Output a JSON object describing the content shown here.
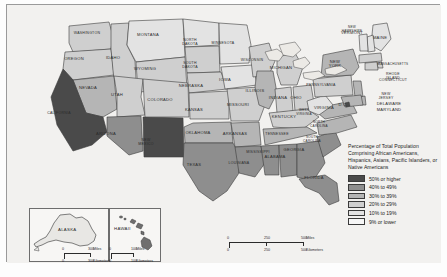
{
  "map": {
    "title_hidden": "",
    "legend": {
      "title": "Percentage of Total Population Comprising African Americans, Hispanics, Asians, Pacific Islanders, or Native Americans",
      "items": [
        {
          "label": "50% or higher",
          "color": "#4a4a4a"
        },
        {
          "label": "40% to 49%",
          "color": "#8e8e8e"
        },
        {
          "label": "30% to 39%",
          "color": "#b5b5b5"
        },
        {
          "label": "20% to 29%",
          "color": "#cfcfcf"
        },
        {
          "label": "10% to 19%",
          "color": "#e3e3e3"
        },
        {
          "label": "9% or lower",
          "color": "#f6f6f6"
        }
      ]
    },
    "scales": {
      "main": {
        "miles_label": "Miles",
        "km_label": "Kilometers",
        "miles_ticks": [
          "0",
          "250",
          "500"
        ],
        "km_ticks": [
          "0",
          "250",
          "500"
        ]
      },
      "alaska": {
        "miles_label": "Miles",
        "km_label": "Kilometers",
        "miles_ticks": [
          "0",
          "300"
        ],
        "km_ticks": [
          "0",
          "300"
        ]
      },
      "hawaii": {
        "miles_label": "Miles",
        "km_label": "Kilometers",
        "miles_ticks": [
          "0",
          "100"
        ],
        "km_ticks": [
          "0",
          "100"
        ]
      }
    },
    "insets": [
      {
        "name": "ALASKA"
      },
      {
        "name": "HAWAII"
      }
    ],
    "states": [
      {
        "name": "WASHINGTON",
        "tier": 3,
        "lx": 86,
        "ly": 33
      },
      {
        "name": "OREGON",
        "tier": 3,
        "lx": 73,
        "ly": 59
      },
      {
        "name": "IDAHO",
        "tier": 3,
        "lx": 112,
        "ly": 58
      },
      {
        "name": "MONTANA",
        "tier": 4,
        "lx": 147,
        "ly": 35
      },
      {
        "name": "WYOMING",
        "tier": 3,
        "lx": 144,
        "ly": 69
      },
      {
        "name": "NEVADA",
        "tier": 2,
        "lx": 87,
        "ly": 88
      },
      {
        "name": "UTAH",
        "tier": 3,
        "lx": 116,
        "ly": 95
      },
      {
        "name": "CALIFORNIA",
        "tier": 0,
        "lx": 58,
        "ly": 113
      },
      {
        "name": "ARIZONA",
        "tier": 1,
        "lx": 105,
        "ly": 134
      },
      {
        "name": "NEW MEXICO",
        "tier": 0,
        "lx": 145,
        "ly": 140
      },
      {
        "name": "COLORADO",
        "tier": 3,
        "lx": 159,
        "ly": 100
      },
      {
        "name": "NORTH DAKOTA",
        "tier": 4,
        "lx": 189,
        "ly": 40
      },
      {
        "name": "SOUTH DAKOTA",
        "tier": 3,
        "lx": 189,
        "ly": 63
      },
      {
        "name": "NEBRASKA",
        "tier": 3,
        "lx": 190,
        "ly": 86
      },
      {
        "name": "KANSAS",
        "tier": 3,
        "lx": 193,
        "ly": 110
      },
      {
        "name": "OKLAHOMA",
        "tier": 2,
        "lx": 197,
        "ly": 133
      },
      {
        "name": "TEXAS",
        "tier": 1,
        "lx": 193,
        "ly": 165
      },
      {
        "name": "MINNESOTA",
        "tier": 4,
        "lx": 222,
        "ly": 43
      },
      {
        "name": "IOWA",
        "tier": 4,
        "lx": 224,
        "ly": 80
      },
      {
        "name": "MISSOURI",
        "tier": 3,
        "lx": 237,
        "ly": 105
      },
      {
        "name": "ARKANSAS",
        "tier": 2,
        "lx": 234,
        "ly": 134
      },
      {
        "name": "LOUISIANA",
        "tier": 1,
        "lx": 238,
        "ly": 163
      },
      {
        "name": "WISCONSIN",
        "tier": 3,
        "lx": 251,
        "ly": 60
      },
      {
        "name": "ILLINOIS",
        "tier": 2,
        "lx": 254,
        "ly": 91
      },
      {
        "name": "MICHIGAN",
        "tier": 3,
        "lx": 280,
        "ly": 68
      },
      {
        "name": "INDIANA",
        "tier": 3,
        "lx": 277,
        "ly": 98
      },
      {
        "name": "OHIO",
        "tier": 3,
        "lx": 295,
        "ly": 98
      },
      {
        "name": "KENTUCKY",
        "tier": 3,
        "lx": 283,
        "ly": 117
      },
      {
        "name": "TENNESSEE",
        "tier": 2,
        "lx": 276,
        "ly": 134
      },
      {
        "name": "MISSISSIPPI",
        "tier": 1,
        "lx": 257,
        "ly": 152
      },
      {
        "name": "ALABAMA",
        "tier": 1,
        "lx": 274,
        "ly": 157
      },
      {
        "name": "GEORGIA",
        "tier": 1,
        "lx": 293,
        "ly": 150
      },
      {
        "name": "FLORIDA",
        "tier": 1,
        "lx": 313,
        "ly": 178
      },
      {
        "name": "SOUTH CAROLINA",
        "tier": 1,
        "lx": 311,
        "ly": 137
      },
      {
        "name": "NORTH CAROLINA",
        "tier": 2,
        "lx": 318,
        "ly": 122
      },
      {
        "name": "VIRGINIA",
        "tier": 2,
        "lx": 323,
        "ly": 108
      },
      {
        "name": "WEST VIRGINIA",
        "tier": 4,
        "lx": 303,
        "ly": 110
      },
      {
        "name": "PENNSYLVANIA",
        "tier": 3,
        "lx": 320,
        "ly": 85
      },
      {
        "name": "NEW YORK",
        "tier": 2,
        "lx": 334,
        "ly": 62
      },
      {
        "name": "MAINE",
        "tier": 4,
        "lx": 379,
        "ly": 38
      },
      {
        "name": "NEW HAMPSHIRE",
        "tier": 4,
        "lx": 351,
        "ly": 27
      },
      {
        "name": "VERMONT",
        "tier": 4,
        "lx": 351,
        "ly": 33
      },
      {
        "name": "MASSACHUSETTS",
        "tier": 3,
        "lx": 392,
        "ly": 64
      },
      {
        "name": "RHODE ISLAND",
        "tier": 3,
        "lx": 392,
        "ly": 74
      },
      {
        "name": "CONNECTICUT",
        "tier": 3,
        "lx": 392,
        "ly": 80
      },
      {
        "name": "NEW JERSEY",
        "tier": 2,
        "lx": 385,
        "ly": 94
      },
      {
        "name": "DELAWARE",
        "tier": 2,
        "lx": 388,
        "ly": 104
      },
      {
        "name": "MARYLAND",
        "tier": 2,
        "lx": 388,
        "ly": 110
      },
      {
        "name": "D.C.",
        "tier": 0,
        "lx": 342,
        "ly": 105
      }
    ]
  }
}
